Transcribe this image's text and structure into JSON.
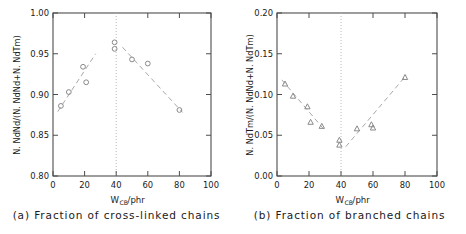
{
  "figure": {
    "panels": [
      {
        "id": "a",
        "caption": "(a) Fraction of cross-linked chains",
        "marker": "circle"
      },
      {
        "id": "b",
        "caption": "(b) Fraction of branched chains",
        "marker": "triangle"
      }
    ]
  },
  "axis": {
    "x_title_main": "W",
    "x_title_sub": "CB",
    "x_title_tail": "/phr",
    "x_ticks": [
      "0",
      "20",
      "40",
      "60",
      "80",
      "100"
    ],
    "panel_a_y_ticks": [
      "0.80",
      "0.85",
      "0.90",
      "0.95",
      "1.00"
    ],
    "panel_b_y_ticks": [
      "0.00",
      "0.05",
      "0.10",
      "0.15",
      "0.20"
    ],
    "panel_a_y_title": "N. NdNd/(N. NdNd+N. NdTm)",
    "panel_b_y_title": "N. NdTm/(N. NdNd+N. NdTm)"
  },
  "colors": {
    "frame": "#4d4d4d",
    "marker": "#8a8a8a",
    "trend": "#a8a8a8",
    "reference": "#b0b0b0",
    "text": "#1a1a1a",
    "background": "#ffffff"
  },
  "chart_data": [
    {
      "type": "scatter",
      "title": "(a) Fraction of cross-linked chains",
      "xlabel": "W_CB/phr",
      "ylabel": "N. NdNd/(N. NdNd+N. NdTm)",
      "xlim": [
        0,
        100
      ],
      "ylim": [
        0.8,
        1.0
      ],
      "xticks": [
        0,
        20,
        40,
        60,
        80,
        100
      ],
      "yticks": [
        0.8,
        0.85,
        0.9,
        0.95,
        1.0
      ],
      "grid": false,
      "legend": "none",
      "marker": "open-circle",
      "reference_line_x": 40,
      "points": [
        {
          "x": 5,
          "y": 0.886
        },
        {
          "x": 10,
          "y": 0.903
        },
        {
          "x": 19,
          "y": 0.934
        },
        {
          "x": 21,
          "y": 0.915
        },
        {
          "x": 39,
          "y": 0.964
        },
        {
          "x": 39,
          "y": 0.956
        },
        {
          "x": 50,
          "y": 0.943
        },
        {
          "x": 60,
          "y": 0.938
        },
        {
          "x": 80,
          "y": 0.881
        }
      ],
      "trend_lines": [
        {
          "name": "ascending",
          "x0": 3,
          "y0": 0.879,
          "x1": 27,
          "y1": 0.95
        },
        {
          "name": "descending",
          "x0": 44,
          "y0": 0.958,
          "x1": 82,
          "y1": 0.878
        }
      ]
    },
    {
      "type": "scatter",
      "title": "(b) Fraction of branched chains",
      "xlabel": "W_CB/phr",
      "ylabel": "N. NdTm/(N. NdNd+N. NdTm)",
      "xlim": [
        0,
        100
      ],
      "ylim": [
        0.0,
        0.2
      ],
      "xticks": [
        0,
        20,
        40,
        60,
        80,
        100
      ],
      "yticks": [
        0.0,
        0.05,
        0.1,
        0.15,
        0.2
      ],
      "grid": false,
      "legend": "none",
      "marker": "open-triangle",
      "reference_line_x": 40,
      "points": [
        {
          "x": 5,
          "y": 0.113
        },
        {
          "x": 10,
          "y": 0.098
        },
        {
          "x": 19,
          "y": 0.085
        },
        {
          "x": 21,
          "y": 0.066
        },
        {
          "x": 28,
          "y": 0.061
        },
        {
          "x": 39,
          "y": 0.044
        },
        {
          "x": 39,
          "y": 0.038
        },
        {
          "x": 50,
          "y": 0.058
        },
        {
          "x": 59,
          "y": 0.063
        },
        {
          "x": 60,
          "y": 0.059
        },
        {
          "x": 80,
          "y": 0.121
        }
      ],
      "trend_lines": [
        {
          "name": "descending",
          "x0": 3,
          "y0": 0.118,
          "x1": 29,
          "y1": 0.058
        },
        {
          "name": "ascending",
          "x0": 43,
          "y0": 0.036,
          "x1": 81,
          "y1": 0.124
        }
      ]
    }
  ]
}
